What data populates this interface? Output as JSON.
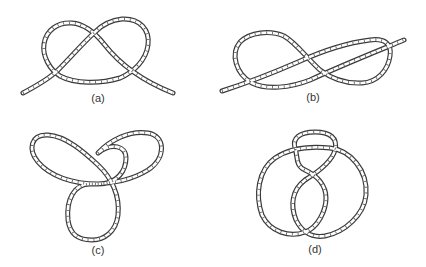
{
  "figure": {
    "panels": [
      {
        "id": "a",
        "label": "(a)",
        "description": "Overhand knot (open, ends free)"
      },
      {
        "id": "b",
        "label": "(b)",
        "description": "Figure-eight knot (open, ends free)"
      },
      {
        "id": "c",
        "label": "(c)",
        "description": "Trefoil knot (closed)"
      },
      {
        "id": "d",
        "label": "(d)",
        "description": "Figure-eight knot (closed)"
      }
    ],
    "colors": {
      "rope_outline": "#3a3a3a",
      "rope_fill": "#ffffff",
      "background": "#ffffff"
    }
  }
}
